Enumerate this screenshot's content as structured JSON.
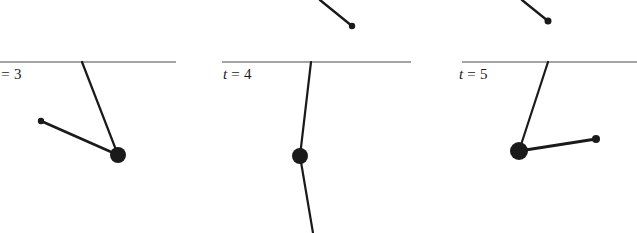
{
  "figure": {
    "name": "double-pendulum-time-series",
    "background_color": "#ffffff",
    "ink_color": "#1a1a1a",
    "width": 637,
    "height": 233
  },
  "panels": [
    {
      "id": "panel-t3",
      "label": {
        "variable": "t",
        "equals": "=",
        "value": "3",
        "full": "t = 3",
        "x": -7,
        "y": 66
      },
      "ceiling": {
        "x1": 0,
        "x2": 176,
        "y": 62
      },
      "pivot": {
        "x": 82,
        "y": 62
      },
      "bob": {
        "x": 118,
        "y": 155,
        "r": 8
      },
      "tip": {
        "x": 41,
        "y": 121,
        "r": 3.2
      },
      "lower_tail": null,
      "upper_stub": null
    },
    {
      "id": "panel-t4",
      "label": {
        "variable": "t",
        "equals": "=",
        "value": "4",
        "full": "t = 4",
        "x": 223,
        "y": 66
      },
      "ceiling": {
        "x1": 222,
        "x2": 411,
        "y": 62
      },
      "pivot": {
        "x": 311,
        "y": 62
      },
      "bob": {
        "x": 300,
        "y": 156,
        "r": 8
      },
      "tip": null,
      "lower_tail": {
        "x1": 300,
        "y1": 156,
        "x2": 313,
        "y2": 233
      },
      "upper_stub": {
        "x1": 320,
        "y1": 0,
        "x2": 352,
        "y2": 26,
        "dot_r": 3.2
      }
    },
    {
      "id": "panel-t5",
      "label": {
        "variable": "t",
        "equals": "=",
        "value": "5",
        "full": "t = 5",
        "x": 459,
        "y": 66
      },
      "ceiling": {
        "x1": 462,
        "x2": 637,
        "y": 62
      },
      "pivot": {
        "x": 548,
        "y": 62
      },
      "bob": {
        "x": 519,
        "y": 151,
        "r": 9
      },
      "tip": {
        "x": 596,
        "y": 139,
        "r": 4
      },
      "lower_tail": null,
      "upper_stub": {
        "x1": 522,
        "y1": 0,
        "x2": 548,
        "y2": 21,
        "dot_r": 3.5
      }
    }
  ]
}
